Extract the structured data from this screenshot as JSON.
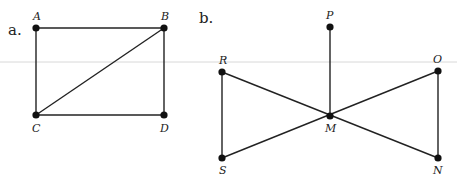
{
  "diagram": {
    "rule_y": 62,
    "figures": [
      {
        "id": "a",
        "label": "a.",
        "label_pos": [
          8,
          35
        ],
        "points": {
          "A": {
            "x": 36,
            "y": 28,
            "label": "A",
            "lx": 33,
            "ly": 20
          },
          "B": {
            "x": 164,
            "y": 28,
            "label": "B",
            "lx": 161,
            "ly": 20
          },
          "C": {
            "x": 36,
            "y": 115,
            "label": "C",
            "lx": 32,
            "ly": 132
          },
          "D": {
            "x": 164,
            "y": 115,
            "label": "D",
            "lx": 160,
            "ly": 132
          }
        },
        "edges": [
          [
            "A",
            "B"
          ],
          [
            "A",
            "C"
          ],
          [
            "B",
            "D"
          ],
          [
            "C",
            "D"
          ],
          [
            "C",
            "B"
          ]
        ]
      },
      {
        "id": "b",
        "label": "b.",
        "label_pos": [
          199,
          23
        ],
        "points": {
          "P": {
            "x": 330,
            "y": 27,
            "label": "P",
            "lx": 326,
            "ly": 19
          },
          "R": {
            "x": 222,
            "y": 72,
            "label": "R",
            "lx": 219,
            "ly": 64
          },
          "O": {
            "x": 438,
            "y": 71,
            "label": "O",
            "lx": 433,
            "ly": 63
          },
          "M": {
            "x": 330,
            "y": 116,
            "label": "M",
            "lx": 325,
            "ly": 132
          },
          "S": {
            "x": 222,
            "y": 158,
            "label": "S",
            "lx": 219,
            "ly": 174
          },
          "N": {
            "x": 438,
            "y": 158,
            "label": "N",
            "lx": 433,
            "ly": 174
          }
        },
        "edges": [
          [
            "P",
            "M"
          ],
          [
            "R",
            "S"
          ],
          [
            "O",
            "N"
          ],
          [
            "R",
            "N"
          ],
          [
            "S",
            "O"
          ]
        ]
      }
    ]
  }
}
